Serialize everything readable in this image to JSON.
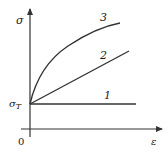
{
  "diagram": {
    "type": "stress-strain curves",
    "axes": {
      "y_label": "σ",
      "x_label": "ε",
      "origin_label": "0",
      "yield_label_main": "σ",
      "yield_label_sub": "T"
    },
    "curves": [
      {
        "id": "1",
        "label": "1",
        "shape": "horizontal line (ideal plastic)"
      },
      {
        "id": "2",
        "label": "2",
        "shape": "straight line (linear hardening)"
      },
      {
        "id": "3",
        "label": "3",
        "shape": "concave curve (nonlinear hardening)"
      }
    ],
    "colors": {
      "line": "#333333",
      "background": "#ffffff"
    }
  }
}
